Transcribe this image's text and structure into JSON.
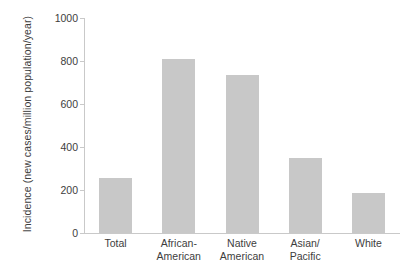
{
  "chart_data": {
    "type": "bar",
    "title": "",
    "subtitle": "",
    "xlabel": "",
    "ylabel": "Incidence (new cases/million population/year)",
    "categories": [
      "Total",
      "African-American",
      "Native American",
      "Asian/Pacific",
      "White"
    ],
    "category_lines": [
      [
        "Total",
        ""
      ],
      [
        "African-",
        "American"
      ],
      [
        "Native",
        "American"
      ],
      [
        "Asian/",
        "Pacific"
      ],
      [
        "White",
        ""
      ]
    ],
    "values": [
      255,
      810,
      735,
      350,
      185
    ],
    "ylim": [
      0,
      1000
    ],
    "yticks": [
      0,
      200,
      400,
      600,
      800,
      1000
    ],
    "ytick_labels": [
      "0",
      "200",
      "400",
      "600",
      "800",
      "1000"
    ],
    "grid": false,
    "legend": false,
    "legend_position": "none",
    "bar_color": "#c8c8c8",
    "axis_color": "#c9c9c9",
    "text_color": "#3d3d3d",
    "background_color": "#ffffff"
  }
}
